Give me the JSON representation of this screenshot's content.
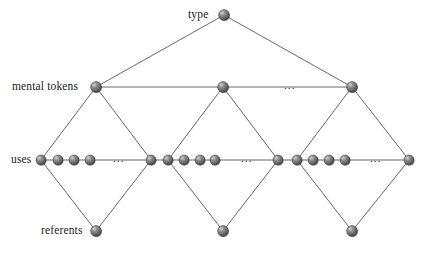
{
  "figure": {
    "type": "node-link-diagram",
    "background_color": "#ffffff",
    "node_color": "#6b6b6b",
    "node_highlight_color": "#c2c2c2",
    "node_outline_color": "#3a3a3a",
    "edge_color": "#555555",
    "text_color": "#1b1b1b",
    "width": 424,
    "height": 255
  },
  "labels": {
    "type": "type",
    "mental_tokens": "mental tokens",
    "uses": "uses",
    "referents": "referents",
    "ellipsis": "..."
  },
  "rows": [
    {
      "name": "type",
      "label": "type",
      "label_x": 188,
      "label_y": 15,
      "y": 15,
      "nodes": [
        {
          "x": 224,
          "y": 15,
          "r": 5.4
        }
      ],
      "ellipses": []
    },
    {
      "name": "mental-tokens",
      "label": "mental tokens",
      "label_x": 12,
      "label_y": 87,
      "y": 87,
      "nodes": [
        {
          "x": 96,
          "y": 87,
          "r": 5.4
        },
        {
          "x": 223,
          "y": 87,
          "r": 5.4
        },
        {
          "x": 352,
          "y": 87,
          "r": 5.4
        }
      ],
      "ellipses": [
        {
          "x": 292,
          "y": 87
        }
      ]
    },
    {
      "name": "uses",
      "label": "uses",
      "label_x": 11,
      "label_y": 160,
      "y": 160,
      "nodes": [
        {
          "x": 41,
          "y": 160,
          "r": 5.0
        },
        {
          "x": 58,
          "y": 160,
          "r": 5.0
        },
        {
          "x": 74,
          "y": 160,
          "r": 5.0
        },
        {
          "x": 90,
          "y": 160,
          "r": 5.0
        },
        {
          "x": 151,
          "y": 160,
          "r": 5.0
        },
        {
          "x": 168,
          "y": 160,
          "r": 5.0
        },
        {
          "x": 184,
          "y": 160,
          "r": 5.0
        },
        {
          "x": 200,
          "y": 160,
          "r": 5.0
        },
        {
          "x": 215,
          "y": 160,
          "r": 5.0
        },
        {
          "x": 278,
          "y": 160,
          "r": 5.0
        },
        {
          "x": 297,
          "y": 160,
          "r": 5.0
        },
        {
          "x": 313,
          "y": 160,
          "r": 5.0
        },
        {
          "x": 329,
          "y": 160,
          "r": 5.0
        },
        {
          "x": 345,
          "y": 160,
          "r": 5.0
        },
        {
          "x": 409,
          "y": 160,
          "r": 5.0
        }
      ],
      "ellipses": [
        {
          "x": 121,
          "y": 160
        },
        {
          "x": 249,
          "y": 160
        },
        {
          "x": 378,
          "y": 160
        }
      ]
    },
    {
      "name": "referents",
      "label": "referents",
      "label_x": 41,
      "label_y": 231,
      "y": 231,
      "nodes": [
        {
          "x": 96,
          "y": 231,
          "r": 5.4
        },
        {
          "x": 223,
          "y": 231,
          "r": 5.4
        },
        {
          "x": 352,
          "y": 231,
          "r": 5.4
        }
      ],
      "ellipses": []
    }
  ],
  "edges": [
    {
      "x1": 224,
      "y1": 15,
      "x2": 96,
      "y2": 87
    },
    {
      "x1": 224,
      "y1": 15,
      "x2": 352,
      "y2": 87
    },
    {
      "x1": 96,
      "y1": 87,
      "x2": 223,
      "y2": 87
    },
    {
      "x1": 223,
      "y1": 87,
      "x2": 352,
      "y2": 87
    },
    {
      "x1": 96,
      "y1": 87,
      "x2": 41,
      "y2": 160
    },
    {
      "x1": 96,
      "y1": 87,
      "x2": 151,
      "y2": 160
    },
    {
      "x1": 223,
      "y1": 87,
      "x2": 168,
      "y2": 160
    },
    {
      "x1": 223,
      "y1": 87,
      "x2": 278,
      "y2": 160
    },
    {
      "x1": 352,
      "y1": 87,
      "x2": 297,
      "y2": 160
    },
    {
      "x1": 352,
      "y1": 87,
      "x2": 409,
      "y2": 160
    },
    {
      "x1": 41,
      "y1": 160,
      "x2": 90,
      "y2": 160
    },
    {
      "x1": 151,
      "y1": 160,
      "x2": 215,
      "y2": 160
    },
    {
      "x1": 278,
      "y1": 160,
      "x2": 345,
      "y2": 160
    },
    {
      "x1": 90,
      "y1": 160,
      "x2": 121,
      "y2": 160
    },
    {
      "x1": 121,
      "y1": 160,
      "x2": 151,
      "y2": 160
    },
    {
      "x1": 215,
      "y1": 160,
      "x2": 249,
      "y2": 160
    },
    {
      "x1": 249,
      "y1": 160,
      "x2": 278,
      "y2": 160
    },
    {
      "x1": 345,
      "y1": 160,
      "x2": 378,
      "y2": 160
    },
    {
      "x1": 378,
      "y1": 160,
      "x2": 409,
      "y2": 160
    },
    {
      "x1": 41,
      "y1": 160,
      "x2": 96,
      "y2": 231
    },
    {
      "x1": 151,
      "y1": 160,
      "x2": 96,
      "y2": 231
    },
    {
      "x1": 168,
      "y1": 160,
      "x2": 223,
      "y2": 231
    },
    {
      "x1": 278,
      "y1": 160,
      "x2": 223,
      "y2": 231
    },
    {
      "x1": 297,
      "y1": 160,
      "x2": 352,
      "y2": 231
    },
    {
      "x1": 409,
      "y1": 160,
      "x2": 352,
      "y2": 231
    }
  ]
}
